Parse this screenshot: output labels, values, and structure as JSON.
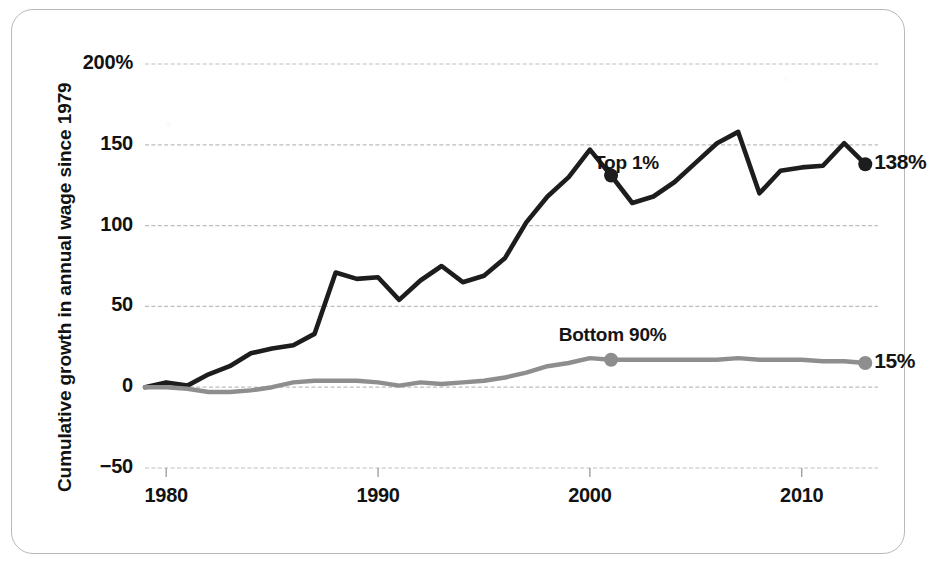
{
  "chart_data": {
    "type": "line",
    "title": "",
    "xlabel": "",
    "ylabel": "Cumulative growth in annual wage since 1979",
    "xlim": [
      1979,
      2013.6
    ],
    "ylim": [
      -50,
      200
    ],
    "grid": true,
    "y_ticks": [
      "200%",
      "150",
      "100",
      "50",
      "0",
      "-50"
    ],
    "y_tick_values": [
      200,
      150,
      100,
      50,
      0,
      -50
    ],
    "x_ticks": [
      "1980",
      "1990",
      "2000",
      "2010"
    ],
    "x_tick_values": [
      1980,
      1990,
      2000,
      2010
    ],
    "legend_position": "inline-annotations",
    "x": [
      1979,
      1980,
      1981,
      1982,
      1983,
      1984,
      1985,
      1986,
      1987,
      1988,
      1989,
      1990,
      1991,
      1992,
      1993,
      1994,
      1995,
      1996,
      1997,
      1998,
      1999,
      2000,
      2001,
      2002,
      2003,
      2004,
      2005,
      2006,
      2007,
      2008,
      2009,
      2010,
      2011,
      2012,
      2013
    ],
    "series": [
      {
        "name": "Top 1%",
        "color": "#1d1d1d",
        "end_value": 138,
        "end_label": "138%",
        "label_x": 2000.2,
        "values": [
          0,
          3,
          1,
          8,
          13,
          21,
          24,
          26,
          33,
          71,
          67,
          68,
          54,
          66,
          75,
          65,
          69,
          80,
          102,
          118,
          130,
          147,
          131,
          114,
          118,
          127,
          139,
          151,
          158,
          120,
          134,
          136,
          137,
          151,
          138
        ],
        "markers": [
          {
            "x": 2001,
            "y": 131
          },
          {
            "x": 2013,
            "y": 138
          }
        ]
      },
      {
        "name": "Bottom 90%",
        "color": "#8e8e8e",
        "end_value": 15,
        "end_label": "15%",
        "label_x": 1999.0,
        "values": [
          0,
          0,
          -1,
          -3,
          -3,
          -2,
          0,
          3,
          4,
          4,
          4,
          3,
          1,
          3,
          2,
          3,
          4,
          6,
          9,
          13,
          15,
          18,
          17,
          17,
          17,
          17,
          17,
          17,
          18,
          17,
          17,
          17,
          16,
          16,
          15
        ],
        "markers": [
          {
            "x": 2001,
            "y": 17
          },
          {
            "x": 2013,
            "y": 15
          }
        ]
      }
    ]
  },
  "axis": {
    "y_title": "Cumulative growth in annual wage since 1979"
  },
  "colors": {
    "top_series": "#1d1d1d",
    "bottom_series": "#8e8e8e",
    "gridline": "#bdbdbd",
    "frame": "#b9b9b9",
    "text": "#121212"
  }
}
